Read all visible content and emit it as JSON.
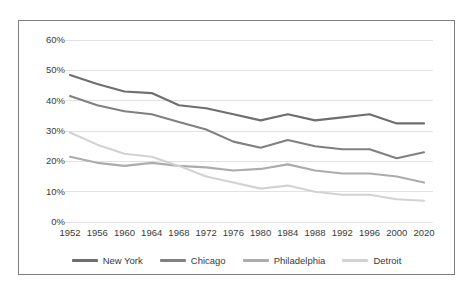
{
  "chart_data": {
    "type": "line",
    "title": "",
    "subtitle": "",
    "xlabel": "",
    "ylabel": "",
    "categories": [
      "1952",
      "1956",
      "1960",
      "1964",
      "1968",
      "1972",
      "1976",
      "1980",
      "1984",
      "1988",
      "1992",
      "1996",
      "2000",
      "2020"
    ],
    "ytick_labels": [
      "60%",
      "50%",
      "40%",
      "30%",
      "20%",
      "10%",
      "0%"
    ],
    "ytick_values": [
      60,
      50,
      40,
      30,
      20,
      10,
      0
    ],
    "ylim": [
      0,
      60
    ],
    "grid": "horizontal",
    "legend_position": "bottom",
    "series": [
      {
        "name": "New York",
        "color": "#6e6e6e",
        "values": [
          48.5,
          45.5,
          43.0,
          42.5,
          38.5,
          37.5,
          35.5,
          33.5,
          35.5,
          33.5,
          34.5,
          35.5,
          32.5,
          32.5
        ]
      },
      {
        "name": "Chicago",
        "color": "#808080",
        "values": [
          41.5,
          38.5,
          36.5,
          35.5,
          33.0,
          30.5,
          26.5,
          24.5,
          27.0,
          25.0,
          24.0,
          24.0,
          21.0,
          23.0
        ]
      },
      {
        "name": "Philadelphia",
        "color": "#acacac",
        "values": [
          21.5,
          19.5,
          18.5,
          19.5,
          18.5,
          18.0,
          17.0,
          17.5,
          19.0,
          17.0,
          16.0,
          16.0,
          15.0,
          13.0
        ]
      },
      {
        "name": "Detroit",
        "color": "#d2d2d2",
        "values": [
          29.5,
          25.5,
          22.5,
          21.5,
          18.5,
          15.0,
          13.0,
          11.0,
          12.0,
          10.0,
          9.0,
          9.0,
          7.5,
          7.0
        ]
      }
    ]
  },
  "colors": {
    "frame_border": "#7d7d7d",
    "gridline": "#e2e2e2",
    "axis_text": "#3a3a3a",
    "background": "#ffffff"
  }
}
